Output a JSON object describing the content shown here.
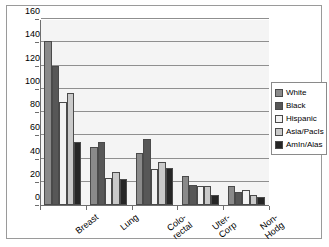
{
  "chart_data": {
    "type": "bar",
    "title": "",
    "xlabel": "",
    "ylabel": "",
    "ylim": [
      0,
      160
    ],
    "yticks": [
      0,
      20,
      40,
      60,
      80,
      100,
      120,
      140,
      160
    ],
    "grid": true,
    "legend_position": "right",
    "categories": [
      "Breast",
      "Lung",
      "Colo-rectal",
      "Uter-Corp",
      "Non-Hodg"
    ],
    "category_lines": [
      [
        "Breast"
      ],
      [
        "Lung"
      ],
      [
        "Colo-",
        "rectal"
      ],
      [
        "Uter-",
        "Corp"
      ],
      [
        "Non-",
        "Hodg"
      ]
    ],
    "series": [
      {
        "name": "White",
        "color": "#8a8a8a",
        "values": [
          141,
          50,
          45,
          25,
          16
        ]
      },
      {
        "name": "Black",
        "color": "#575757",
        "values": [
          120,
          54,
          57,
          17,
          11
        ]
      },
      {
        "name": "Hispanic",
        "color": "#f2f2f2",
        "values": [
          89,
          23,
          31,
          16,
          13
        ]
      },
      {
        "name": "Asia/PacIs",
        "color": "#c9c9c9",
        "values": [
          96,
          28,
          37,
          16,
          9
        ]
      },
      {
        "name": "AmIn/Alas",
        "color": "#262626",
        "values": [
          54,
          22,
          32,
          9,
          7
        ]
      }
    ]
  },
  "colors": {
    "plot_background": "#f4f4f4",
    "gridline": "#8f8f8f",
    "axis": "#6e6e6e",
    "frame_border": "#9a9a9a",
    "bar_outline": "#4a4a4a"
  }
}
